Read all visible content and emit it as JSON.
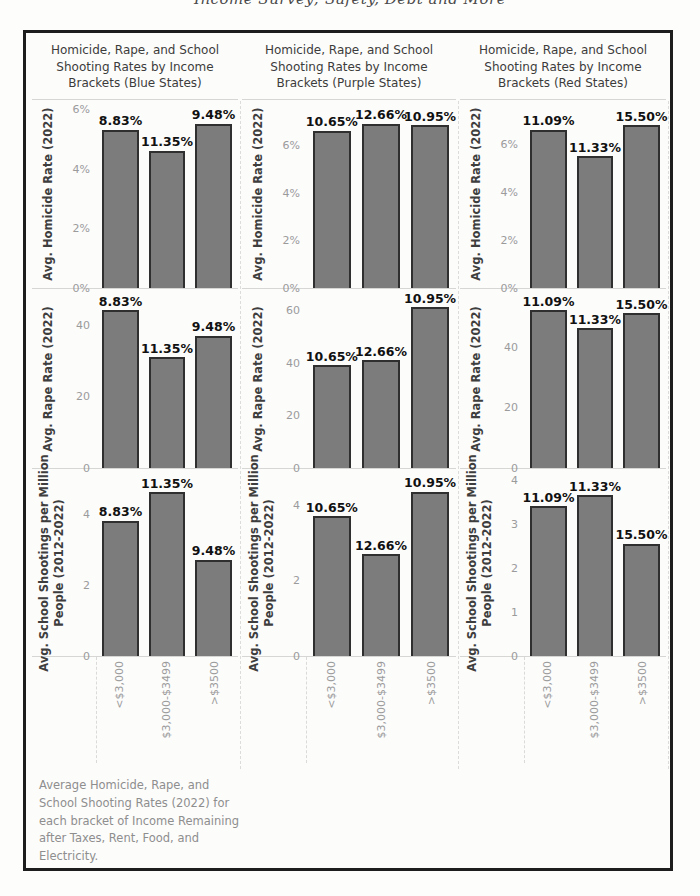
{
  "page": {
    "top_clipped_text": "Income Survey; Safety, Debt and More"
  },
  "caption": "Average Homicide, Rape, and School Shooting Rates (2022) for each bracket of Income Remaining after Taxes, Rent, Food, and Electricity.",
  "chart_data": {
    "type": "bar",
    "layout": "3x3 small multiples (rows = metrics, columns = state groups)",
    "categories": [
      "<$3,000",
      "$3,000-$3499",
      ">$3500"
    ],
    "columns": [
      {
        "title": "Homicide, Rape, and School Shooting Rates by Income Brackets (Blue States)",
        "bar_labels": [
          "8.83%",
          "11.35%",
          "9.48%"
        ]
      },
      {
        "title": "Homicide, Rape, and School Shooting Rates by Income Brackets (Purple States)",
        "bar_labels": [
          "10.65%",
          "12.66%",
          "10.95%"
        ]
      },
      {
        "title": "Homicide, Rape, and School Shooting Rates by Income Brackets (Red States)",
        "bar_labels": [
          "11.09%",
          "11.33%",
          "15.50%"
        ]
      }
    ],
    "rows": [
      {
        "ylabel_lines": [
          "Avg. Homicide Rate (2022)"
        ]
      },
      {
        "ylabel_lines": [
          "Avg. Rape Rate (2022)"
        ]
      },
      {
        "ylabel_lines": [
          "Avg. School Shootings per Million",
          "People (2012-2022)"
        ]
      }
    ],
    "charts": [
      [
        {
          "values": [
            5.3,
            4.6,
            5.5
          ],
          "ymax": 6.3,
          "yticks": [
            {
              "v": 0,
              "label": "0%"
            },
            {
              "v": 2,
              "label": "2%"
            },
            {
              "v": 4,
              "label": "4%"
            },
            {
              "v": 6,
              "label": "6%"
            }
          ]
        },
        {
          "values": [
            6.6,
            6.9,
            6.85
          ],
          "ymax": 7.9,
          "yticks": [
            {
              "v": 0,
              "label": "0%"
            },
            {
              "v": 2,
              "label": "2%"
            },
            {
              "v": 4,
              "label": "4%"
            },
            {
              "v": 6,
              "label": "6%"
            }
          ]
        },
        {
          "values": [
            6.6,
            5.5,
            6.8
          ],
          "ymax": 7.85,
          "yticks": [
            {
              "v": 0,
              "label": "0%"
            },
            {
              "v": 2,
              "label": "2%"
            },
            {
              "v": 4,
              "label": "4%"
            },
            {
              "v": 6,
              "label": "6%"
            }
          ]
        }
      ],
      [
        {
          "values": [
            44,
            31,
            37
          ],
          "ymax": 50,
          "yticks": [
            {
              "v": 0,
              "label": "0"
            },
            {
              "v": 20,
              "label": "20"
            },
            {
              "v": 40,
              "label": "40"
            }
          ]
        },
        {
          "values": [
            39,
            41,
            61
          ],
          "ymax": 68,
          "yticks": [
            {
              "v": 0,
              "label": "0"
            },
            {
              "v": 20,
              "label": "20"
            },
            {
              "v": 40,
              "label": "40"
            },
            {
              "v": 60,
              "label": "60"
            }
          ]
        },
        {
          "values": [
            52,
            46,
            51
          ],
          "ymax": 59,
          "yticks": [
            {
              "v": 0,
              "label": "0"
            },
            {
              "v": 20,
              "label": "20"
            },
            {
              "v": 40,
              "label": "40"
            }
          ]
        }
      ],
      [
        {
          "values": [
            3.8,
            4.6,
            2.7
          ],
          "ymax": 5.25,
          "yticks": [
            {
              "v": 0,
              "label": "0"
            },
            {
              "v": 2,
              "label": "2"
            },
            {
              "v": 4,
              "label": "4"
            }
          ]
        },
        {
          "values": [
            3.7,
            2.7,
            4.35
          ],
          "ymax": 4.95,
          "yticks": [
            {
              "v": 0,
              "label": "0"
            },
            {
              "v": 2,
              "label": "2"
            },
            {
              "v": 4,
              "label": "4"
            }
          ]
        },
        {
          "values": [
            3.4,
            3.65,
            2.55
          ],
          "ymax": 4.25,
          "yticks": [
            {
              "v": 0,
              "label": "0"
            },
            {
              "v": 1,
              "label": "1"
            },
            {
              "v": 2,
              "label": "2"
            },
            {
              "v": 3,
              "label": "3"
            },
            {
              "v": 4,
              "label": "4"
            }
          ]
        }
      ]
    ]
  }
}
